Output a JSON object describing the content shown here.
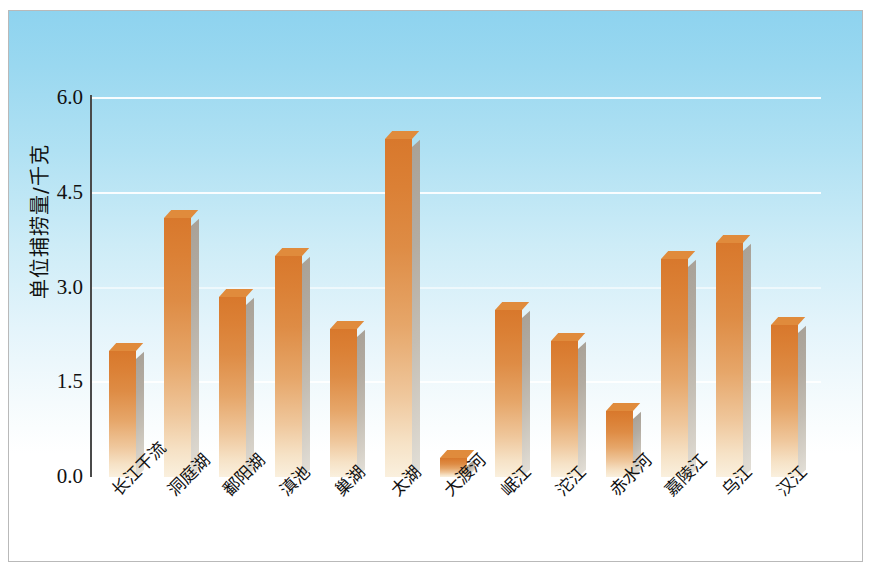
{
  "chart_data": {
    "type": "bar",
    "title": "",
    "xlabel": "",
    "ylabel": "单位捕捞量/千克",
    "ylim": [
      0,
      6.0
    ],
    "yticks": [
      "0.0",
      "1.5",
      "3.0",
      "4.5",
      "6.0"
    ],
    "ytick_values": [
      0.0,
      1.5,
      3.0,
      4.5,
      6.0
    ],
    "grid": true,
    "legend": null,
    "bar_color": "#db8035",
    "categories": [
      "长江干流",
      "洞庭湖",
      "鄱阳湖",
      "滇池",
      "巢湖",
      "太湖",
      "大渡河",
      "岷江",
      "沱江",
      "赤水河",
      "嘉陵江",
      "乌江",
      "汉江"
    ],
    "values": [
      2.0,
      4.1,
      2.85,
      3.5,
      2.35,
      5.35,
      0.3,
      2.65,
      2.15,
      1.05,
      3.45,
      3.7,
      2.4
    ]
  },
  "figure": {
    "background_top_color": "#8ed3ef",
    "background_bottom_color": "#ffffff",
    "border_color": "#b9b9b9"
  }
}
